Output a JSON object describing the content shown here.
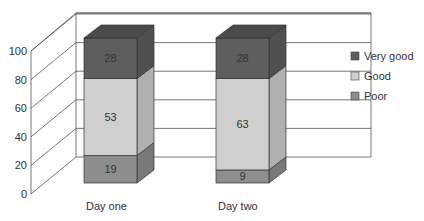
{
  "chart_data": {
    "type": "bar",
    "subtype": "stacked-3d",
    "title": "",
    "xlabel": "",
    "ylabel": "",
    "ylim": [
      0,
      100
    ],
    "yticks": [
      "0",
      "20",
      "40",
      "60",
      "80",
      "100"
    ],
    "categories": [
      "Day one",
      "Day two"
    ],
    "series": [
      {
        "name": "Poor",
        "values": [
          19,
          9
        ],
        "color": "#8e8e8e"
      },
      {
        "name": "Good",
        "values": [
          53,
          63
        ],
        "color": "#cfcfcf"
      },
      {
        "name": "Very good",
        "values": [
          28,
          28
        ],
        "color": "#5e5e5e"
      }
    ],
    "legend": {
      "position": "right",
      "entries": [
        "Very good",
        "Good",
        "Poor"
      ]
    },
    "grid": true,
    "data_labels": true
  }
}
